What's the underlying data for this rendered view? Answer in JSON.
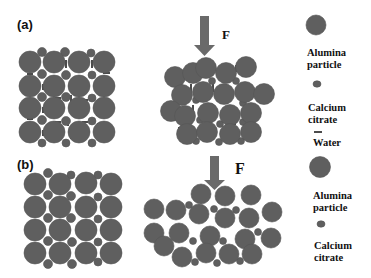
{
  "figure": {
    "panels": [
      {
        "label": "(a)",
        "force_label": "F",
        "description": "Alumina particles with calcium citrate and water bridges; ordered and compressed states"
      },
      {
        "label": "(b)",
        "force_label": "F",
        "description": "Alumina particles with calcium citrate only; ordered and compressed states"
      }
    ],
    "legend_a": {
      "items": [
        {
          "label_line1": "Alumina",
          "label_line2": "particle",
          "symbol": "large-circle"
        },
        {
          "label_line1": "Calcium",
          "label_line2": "citrate",
          "symbol": "small-circle"
        },
        {
          "label_line1": "Water",
          "label_line2": "",
          "symbol": "short-dash"
        }
      ]
    },
    "legend_b": {
      "items": [
        {
          "label_line1": "Alumina",
          "label_line2": "particle",
          "symbol": "large-circle"
        },
        {
          "label_line1": "Calcium",
          "label_line2": "citrate",
          "symbol": "small-circle"
        }
      ]
    },
    "colors": {
      "particle": "#5f5f5f",
      "particle_edge": "#4e4e4e",
      "arrow": "#6a6a6a",
      "water": "#222222",
      "background": "#ffffff"
    }
  }
}
